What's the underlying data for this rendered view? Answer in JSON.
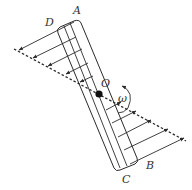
{
  "figure": {
    "type": "mechanics-diagram",
    "labels": {
      "A": "A",
      "B": "B",
      "C": "C",
      "D": "D",
      "O": "O",
      "omega": "ω"
    },
    "colors": {
      "stroke": "#2a2a2a",
      "label": "#333333",
      "background": "#ffffff"
    },
    "arrow_rows": {
      "upper_count": 5,
      "upper_direction": "left",
      "lower_count": 5,
      "lower_direction": "right"
    }
  }
}
